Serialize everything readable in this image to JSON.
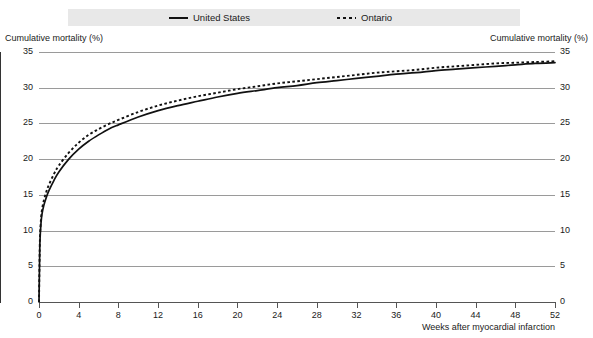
{
  "legend": {
    "entries": [
      {
        "label": "United States",
        "style": "solid",
        "color": "#111111"
      },
      {
        "label": "Ontario",
        "style": "dotted",
        "color": "#111111"
      }
    ],
    "band_color": "#e8e8e8"
  },
  "axes": {
    "y_title_left": "Cumulative mortality (%)",
    "y_title_right": "Cumulative mortality (%)",
    "x_title": "Weeks after myocardial infarction",
    "y_ticks": [
      "0",
      "5",
      "10",
      "15",
      "20",
      "25",
      "30",
      "35"
    ],
    "x_ticks": [
      "0",
      "4",
      "8",
      "12",
      "16",
      "20",
      "24",
      "28",
      "32",
      "36",
      "40",
      "44",
      "48",
      "52"
    ]
  },
  "chart_data": {
    "type": "line",
    "title": "",
    "subtitle": "",
    "xlabel": "Weeks after myocardial infarction",
    "ylabel": "Cumulative mortality (%)",
    "xlim": [
      0,
      52
    ],
    "ylim": [
      0,
      35
    ],
    "ytick_values": [
      0,
      5,
      10,
      15,
      20,
      25,
      30,
      35
    ],
    "xtick_values": [
      0,
      4,
      8,
      12,
      16,
      20,
      24,
      28,
      32,
      36,
      40,
      44,
      48,
      52
    ],
    "grid": "horizontal",
    "legend_position": "top",
    "x": [
      0,
      0.05,
      0.1,
      0.2,
      0.3,
      0.5,
      0.75,
      1,
      1.5,
      2,
      3,
      4,
      5,
      6,
      7,
      8,
      10,
      12,
      14,
      16,
      18,
      20,
      22,
      24,
      26,
      28,
      30,
      32,
      34,
      36,
      38,
      40,
      42,
      44,
      46,
      48,
      50,
      52
    ],
    "series": [
      {
        "name": "United States",
        "style": "solid",
        "color": "#111111",
        "values": [
          0,
          5.0,
          8.6,
          11.0,
          12.3,
          13.6,
          14.7,
          15.6,
          17.0,
          18.2,
          20.0,
          21.4,
          22.5,
          23.4,
          24.2,
          24.8,
          25.9,
          26.8,
          27.5,
          28.1,
          28.7,
          29.2,
          29.6,
          30.0,
          30.3,
          30.7,
          31.0,
          31.3,
          31.6,
          31.9,
          32.1,
          32.4,
          32.6,
          32.8,
          33.0,
          33.2,
          33.4,
          33.5
        ]
      },
      {
        "name": "Ontario",
        "style": "dotted",
        "color": "#111111",
        "values": [
          0,
          5.3,
          9.1,
          11.6,
          12.9,
          14.3,
          15.5,
          16.4,
          17.9,
          19.1,
          20.9,
          22.3,
          23.4,
          24.2,
          24.9,
          25.5,
          26.6,
          27.5,
          28.2,
          28.8,
          29.3,
          29.8,
          30.2,
          30.6,
          30.9,
          31.2,
          31.5,
          31.8,
          32.1,
          32.3,
          32.5,
          32.8,
          33.0,
          33.2,
          33.4,
          33.5,
          33.6,
          33.7
        ]
      }
    ]
  }
}
